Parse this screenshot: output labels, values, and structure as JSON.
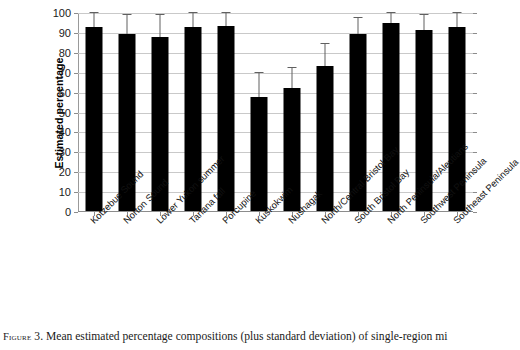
{
  "figure": {
    "caption_prefix": "Figure",
    "caption_text": " 3. Mean estimated percentage compositions (plus standard deviation) of single-region mi"
  },
  "chart_data": {
    "type": "bar",
    "title": "",
    "xlabel": "",
    "ylabel": "Estimated percentage",
    "ylim": [
      0,
      100
    ],
    "yticks": [
      0,
      10,
      20,
      30,
      40,
      50,
      60,
      70,
      80,
      90,
      100
    ],
    "grid": true,
    "legend": "none",
    "error_bars": "plus standard deviation",
    "categories": [
      "Kotzebue Sound",
      "Norton Sound",
      "Lower Yukon summer",
      "Tanana fall",
      "Porcupine",
      "Kuskokwim",
      "Nushagak",
      "North/Central Bristol Bay",
      "South Bristol Bay",
      "North Peninsula/Aleutians",
      "Southwest Peninsula",
      "Southeast Peninsula"
    ],
    "values": [
      93,
      89.5,
      88,
      93,
      93.5,
      58,
      62.5,
      73.5,
      89.5,
      95,
      91.5,
      93
    ],
    "errors": [
      7,
      9.5,
      11,
      7,
      6.5,
      12,
      10,
      11,
      8,
      5,
      7.5,
      7
    ],
    "bar_color": "#000000",
    "error_bar_color": "#606060",
    "grid_color": "#c9c9c9"
  }
}
